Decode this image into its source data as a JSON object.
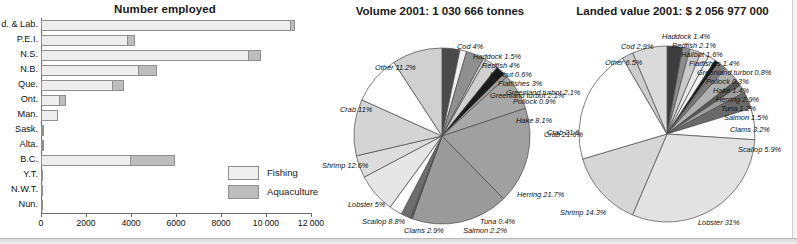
{
  "figure": {
    "bottom_edge": true
  },
  "bar_chart": {
    "title": "Number employed",
    "legend": [
      {
        "label": "Fishing",
        "color": "#eeeeee"
      },
      {
        "label": "Aquaculture",
        "color": "#bdbdbd"
      }
    ],
    "axis_ticks": [
      "0",
      "2000",
      "4000",
      "6000",
      "8000",
      "10 000",
      "12 000"
    ]
  },
  "pie_volume": {
    "title": "Volume 2001: 1 030 666 tonnes"
  },
  "pie_value": {
    "title": "Landed value 2001: $ 2 056 977 000"
  },
  "chart_data": [
    {
      "type": "bar",
      "title": "Number employed",
      "orientation": "horizontal",
      "stacked": true,
      "xlabel": "",
      "ylabel": "",
      "xlim": [
        0,
        12000
      ],
      "xticks": [
        0,
        2000,
        4000,
        6000,
        8000,
        10000,
        12000
      ],
      "xticklabels": [
        "0",
        "2000",
        "4000",
        "6000",
        "8000",
        "10 000",
        "12 000"
      ],
      "grid": false,
      "legend_position": "inside-lower-right",
      "categories": [
        "d. & Lab.",
        "P.E.I.",
        "N.S.",
        "N.B.",
        "Que.",
        "Ont.",
        "Man.",
        "Sask.",
        "Alta.",
        "B.C.",
        "Y.T.",
        "N.W.T.",
        "Nun."
      ],
      "series": [
        {
          "name": "Fishing",
          "values": [
            11100,
            3850,
            9250,
            4350,
            3200,
            830,
            740,
            60,
            60,
            4020,
            25,
            25,
            30
          ]
        },
        {
          "name": "Aquaculture",
          "values": [
            250,
            350,
            550,
            850,
            520,
            330,
            0,
            20,
            20,
            1980,
            0,
            0,
            0
          ]
        }
      ]
    },
    {
      "type": "pie",
      "title": "Volume 2001: 1 030 666 tonnes",
      "total_label": "1 030 666 tonnes",
      "unit": "%",
      "labels": [
        "Cod",
        "Haddock",
        "Redfish",
        "Halibut",
        "Flatfishes",
        "Greenland turbot",
        "Pollock",
        "Hake",
        "Crab",
        "Herring",
        "Tuna",
        "Salmon",
        "Clams",
        "Scallop",
        "Lobster",
        "Shrimp",
        "Crab (west)",
        "Other"
      ],
      "slices": [
        {
          "label": "Cod 4%",
          "name": "Cod",
          "value": 4.0
        },
        {
          "label": "Haddock 1.5%",
          "name": "Haddock",
          "value": 1.5
        },
        {
          "label": "Redfish 4%",
          "name": "Redfish",
          "value": 4.0
        },
        {
          "label": "Halibut 0.6%",
          "name": "Halibut",
          "value": 0.6
        },
        {
          "label": "Flatfishes 3%",
          "name": "Flatfishes",
          "value": 3.0
        },
        {
          "label": "Greenland turbot 2.1%",
          "name": "Greenland turbot",
          "value": 2.1
        },
        {
          "label": "Pollock 0.9%",
          "name": "Pollock",
          "value": 0.9
        },
        {
          "label": "Hake 8.1%",
          "name": "Hake",
          "value": 8.1
        },
        {
          "label": "Crab 21.6%",
          "name": "Crab",
          "value": 21.6
        },
        {
          "label": "Herring 21.7%",
          "name": "Herring",
          "value": 21.7
        },
        {
          "label": "Tuna 0.4%",
          "name": "Tuna",
          "value": 0.4
        },
        {
          "label": "Salmon 2.2%",
          "name": "Salmon",
          "value": 2.2
        },
        {
          "label": "Clams 2.9%",
          "name": "Clams",
          "value": 2.9
        },
        {
          "label": "Scallop 8.8%",
          "name": "Scallop",
          "value": 8.8
        },
        {
          "label": "Lobster 5%",
          "name": "Lobster",
          "value": 5.0
        },
        {
          "label": "Shrimp 12.6%",
          "name": "Shrimp",
          "value": 12.6
        },
        {
          "label": "Crab 11%",
          "name": "Crab",
          "value": 11.0
        },
        {
          "label": "Other 11.2%",
          "name": "Other",
          "value": 11.2
        }
      ]
    },
    {
      "type": "pie",
      "title": "Landed value 2001: $ 2 056 977 000",
      "total_label": "$ 2 056 977 000",
      "unit": "%",
      "slices": [
        {
          "label": "Cod 2.9%",
          "name": "Cod",
          "value": 2.9
        },
        {
          "label": "Haddock 1.4%",
          "name": "Haddock",
          "value": 1.4
        },
        {
          "label": "Redfish 2.1%",
          "name": "Redfish",
          "value": 2.1
        },
        {
          "label": "Halibut 1.6%",
          "name": "Halibut",
          "value": 1.6
        },
        {
          "label": "Flatfishes 1.4%",
          "name": "Flatfishes",
          "value": 1.4
        },
        {
          "label": "Greenland turbot 0.8%",
          "name": "Greenland turbot",
          "value": 0.8
        },
        {
          "label": "Pollock 0.3%",
          "name": "Pollock",
          "value": 0.3
        },
        {
          "label": "Hake 1.4%",
          "name": "Hake",
          "value": 1.4
        },
        {
          "label": "Herring 2.9%",
          "name": "Herring",
          "value": 2.9
        },
        {
          "label": "Tuna 1.2%",
          "name": "Tuna",
          "value": 1.2
        },
        {
          "label": "Salmon 1.5%",
          "name": "Salmon",
          "value": 1.5
        },
        {
          "label": "Clams 3.2%",
          "name": "Clams",
          "value": 3.2
        },
        {
          "label": "Scallop 5.9%",
          "name": "Scallop",
          "value": 5.9
        },
        {
          "label": "Lobster 31%",
          "name": "Lobster",
          "value": 31.0
        },
        {
          "label": "Shrimp 14.3%",
          "name": "Shrimp",
          "value": 14.3
        },
        {
          "label": "Crab 21.6%",
          "name": "Crab",
          "value": 21.6
        },
        {
          "label": "Greenland turbot 2.1%",
          "name": "Greenland turbot (left)",
          "value": 2.1
        },
        {
          "label": "Other 6.5%",
          "name": "Other",
          "value": 6.5
        }
      ]
    }
  ],
  "pie_volume_labels": [
    {
      "text": "Cod 4%",
      "x": 137,
      "y": 42,
      "align": "left"
    },
    {
      "text": "Haddock 1.5%",
      "x": 153,
      "y": 52,
      "align": "left"
    },
    {
      "text": "Redfish 4%",
      "x": 162,
      "y": 61,
      "align": "left"
    },
    {
      "text": "Halibut 0.6%",
      "x": 170,
      "y": 70,
      "align": "left"
    },
    {
      "text": "Flatfishes 3%",
      "x": 178,
      "y": 79,
      "align": "left"
    },
    {
      "text": "Greenland turbot 2.1%",
      "x": 186,
      "y": 88,
      "align": "left"
    },
    {
      "text": "Pollock 0.9%",
      "x": 193,
      "y": 97,
      "align": "left"
    },
    {
      "text": "Hake 8.1%",
      "x": 196,
      "y": 116,
      "align": "left"
    },
    {
      "text": "Crab 21.6%",
      "x": 227,
      "y": 128,
      "align": "left"
    },
    {
      "text": "Herring  21.7%",
      "x": 197,
      "y": 190,
      "align": "left"
    },
    {
      "text": "Tuna 0.4%",
      "x": 160,
      "y": 217,
      "align": "left"
    },
    {
      "text": "Salmon 2.2%",
      "x": 143,
      "y": 226,
      "align": "left"
    },
    {
      "text": "Clams 2.9%",
      "x": 84,
      "y": 226,
      "align": "left"
    },
    {
      "text": "Scallop 8.8%",
      "x": 42,
      "y": 217,
      "align": "left"
    },
    {
      "text": "Lobster 5%",
      "x": 28,
      "y": 200,
      "align": "left"
    },
    {
      "text": "Shrimp 12.6%",
      "x": 2,
      "y": 161,
      "align": "left"
    },
    {
      "text": "Crab 11%",
      "x": 20,
      "y": 105,
      "align": "left"
    },
    {
      "text": "Other 11.2%",
      "x": 55,
      "y": 63,
      "align": "left"
    }
  ],
  "pie_value_labels": [
    {
      "text": "Haddock 1.4%",
      "x": 110,
      "y": 32,
      "align": "left"
    },
    {
      "text": "Redfish 2.1%",
      "x": 120,
      "y": 41,
      "align": "left"
    },
    {
      "text": "Halibut 1.6%",
      "x": 129,
      "y": 50,
      "align": "left"
    },
    {
      "text": "Flatfishes 1.4%",
      "x": 137,
      "y": 59,
      "align": "left"
    },
    {
      "text": "Greenland turbot 0.8%",
      "x": 145,
      "y": 68,
      "align": "left"
    },
    {
      "text": "Pollock 0.3%",
      "x": 154,
      "y": 77,
      "align": "left"
    },
    {
      "text": "Hake 1.4%",
      "x": 161,
      "y": 86,
      "align": "left"
    },
    {
      "text": "Herring 2.9%",
      "x": 164,
      "y": 95,
      "align": "left"
    },
    {
      "text": "Tuna 1.2%",
      "x": 169,
      "y": 104,
      "align": "left"
    },
    {
      "text": "Salmon 1.5%",
      "x": 172,
      "y": 113,
      "align": "left"
    },
    {
      "text": "Clams 3.2%",
      "x": 178,
      "y": 125,
      "align": "left"
    },
    {
      "text": "Scallop 5.9%",
      "x": 186,
      "y": 145,
      "align": "left"
    },
    {
      "text": "Lobster 31%",
      "x": 146,
      "y": 218,
      "align": "left"
    },
    {
      "text": "Shrimp 14.3%",
      "x": 8,
      "y": 208,
      "align": "left"
    },
    {
      "text": "Crab 21.6%",
      "x": -8,
      "y": 130,
      "align": "left"
    },
    {
      "text": "Greenland turbot 2.1%",
      "x": -62,
      "y": 91,
      "align": "left"
    },
    {
      "text": "Cod 2.9%",
      "x": 69,
      "y": 42,
      "align": "left"
    },
    {
      "text": "Other 6.5%",
      "x": 53,
      "y": 58,
      "align": "left"
    }
  ]
}
